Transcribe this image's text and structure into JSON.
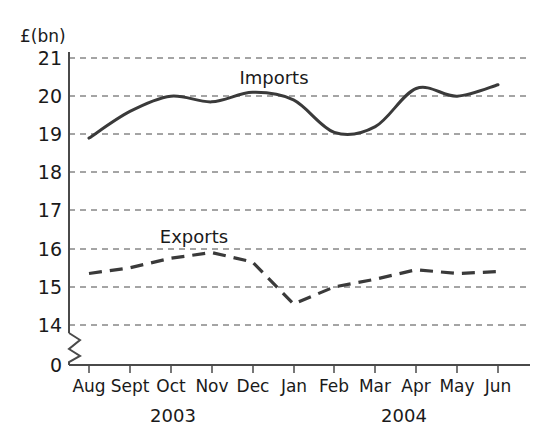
{
  "chart_data": {
    "type": "line",
    "title": "",
    "subtitle": "",
    "ylabel": "£(bn)",
    "xlabel": "",
    "categories": [
      "Aug",
      "Sept",
      "Oct",
      "Nov",
      "Dec",
      "Jan",
      "Feb",
      "Mar",
      "Apr",
      "May",
      "Jun"
    ],
    "year_groups": [
      {
        "label": "2003",
        "from": "Aug",
        "to": "Dec"
      },
      {
        "label": "2004",
        "from": "Jan",
        "to": "Jun"
      }
    ],
    "ylim": [
      14,
      21
    ],
    "yticks": [
      14,
      15,
      16,
      17,
      18,
      19,
      20,
      21
    ],
    "ytick_labels": [
      "14",
      "15",
      "16",
      "17",
      "18",
      "19",
      "20",
      "21"
    ],
    "zero_tick_label": "0",
    "axis_break": true,
    "grid": true,
    "grid_style": "dashed-horizontal",
    "legend_position": "inline-annotation",
    "series": [
      {
        "name": "Imports",
        "style": "solid",
        "color": "#3a3a3a",
        "values": [
          18.9,
          19.6,
          20.0,
          19.85,
          20.1,
          19.9,
          19.05,
          19.2,
          20.2,
          20.0,
          20.3
        ]
      },
      {
        "name": "Exports",
        "style": "dashed",
        "color": "#3a3a3a",
        "values": [
          15.35,
          15.5,
          15.75,
          15.9,
          15.65,
          14.55,
          15.0,
          15.2,
          15.45,
          15.35,
          15.4
        ]
      }
    ],
    "annotations": [
      {
        "name": "imports-label",
        "text": "Imports",
        "near": "Nov"
      },
      {
        "name": "exports-label",
        "text": "Exports",
        "near": "Oct"
      }
    ]
  }
}
